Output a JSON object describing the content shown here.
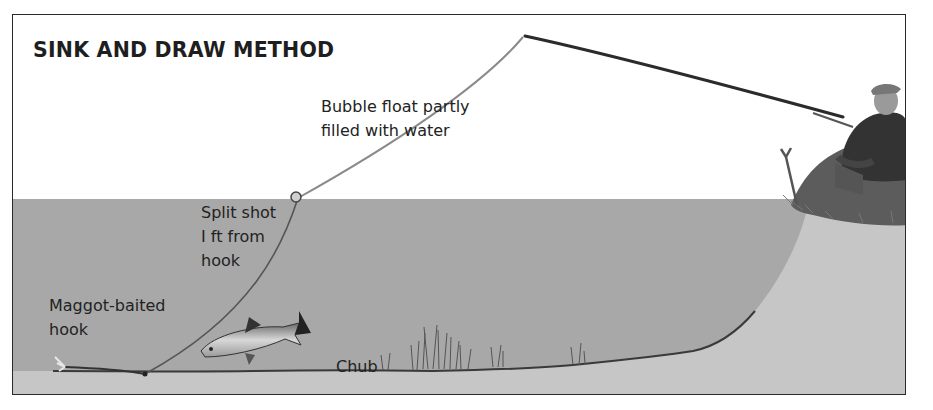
{
  "diagram": {
    "title": "SINK AND DRAW METHOD",
    "labels": {
      "bubble_float": [
        "Bubble float partly",
        "filled with water"
      ],
      "split_shot": [
        "Split shot",
        "I ft from",
        "hook"
      ],
      "maggot_hook": [
        "Maggot-baited",
        "hook"
      ],
      "chub": "Chub"
    },
    "colors": {
      "sky": "#ffffff",
      "water": "#a9a9a9",
      "riverbed": "#c4c4c4",
      "line": "#8a8a8a",
      "rod": "#2b2b2b",
      "grass": "#5a5a5a",
      "angler": "#333333",
      "border": "#2a2a2a"
    }
  }
}
